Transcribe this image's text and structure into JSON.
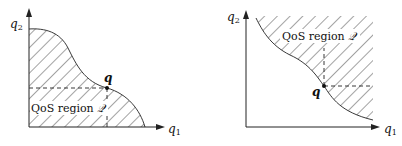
{
  "diagrams": [
    {
      "id": "left",
      "y_axis_label": "q",
      "y_axis_sub": "2",
      "x_axis_label": "q",
      "x_axis_sub": "1",
      "region_label": "QoS region ",
      "region_symbol": "𝒬",
      "point_label": "q",
      "description": "QoS region below the curve (downward-closed)"
    },
    {
      "id": "right",
      "y_axis_label": "q",
      "y_axis_sub": "2",
      "x_axis_label": "q",
      "x_axis_sub": "1",
      "region_label": "QoS region ",
      "region_symbol": "𝒬",
      "point_label": "q",
      "description": "QoS region above the curve (upward-closed)"
    }
  ],
  "colors": {
    "stroke": "#222222",
    "hatch": "#333333",
    "background": "#ffffff"
  }
}
